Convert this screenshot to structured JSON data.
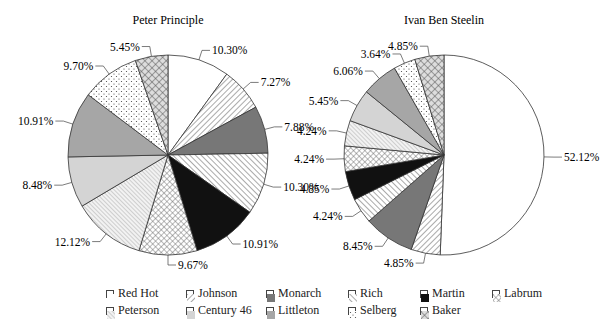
{
  "chart_data": [
    {
      "type": "pie",
      "title": "Peter Principle",
      "categories": [
        "Red Hot",
        "Johnson",
        "Monarch",
        "Rich",
        "Martin",
        "Labrum",
        "Peterson",
        "Century 46",
        "Littleton",
        "Selberg",
        "Baker"
      ],
      "values": [
        10.3,
        7.27,
        7.88,
        10.3,
        10.91,
        9.67,
        12.12,
        8.48,
        10.91,
        9.7,
        5.45
      ],
      "labels": [
        "10.30%",
        "7.27%",
        "7.88%",
        "10.30%",
        "10.91%",
        "9.67%",
        "12.12%",
        "8.48%",
        "10.91%",
        "9.70%",
        "5.45%"
      ],
      "start_angle": "12 o'clock, clockwise"
    },
    {
      "type": "pie",
      "title": "Ivan Ben Steelin",
      "categories": [
        "Red Hot",
        "Johnson",
        "Monarch",
        "Rich",
        "Martin",
        "Labrum",
        "Peterson",
        "Century 46",
        "Littleton",
        "Selberg",
        "Baker"
      ],
      "values": [
        52.12,
        4.85,
        8.45,
        4.24,
        4.85,
        4.24,
        4.24,
        5.45,
        6.06,
        3.64,
        4.85
      ],
      "labels": [
        "52.12%",
        "4.85%",
        "8.45%",
        "4.24%",
        "4.85%",
        "4.24%",
        "4.24%",
        "5.45%",
        "6.06%",
        "3.64%",
        "4.85%"
      ],
      "start_angle": "12 o'clock, clockwise"
    }
  ],
  "legend": {
    "position": "bottom",
    "rows": [
      [
        "Red Hot",
        "Johnson",
        "Monarch",
        "Rich",
        "Martin",
        "Labrum"
      ],
      [
        "Peterson",
        "Century 46",
        "Littleton",
        "Selberg",
        "Baker"
      ]
    ]
  },
  "fills": {
    "Red Hot": "#ffffff",
    "Johnson": "url(#p-diag-r)",
    "Monarch": "#777777",
    "Rich": "url(#p-diag-l)",
    "Martin": "#111111",
    "Labrum": "url(#p-cross)",
    "Peterson": "url(#p-fine)",
    "Century 46": "#d4d4d4",
    "Littleton": "#a6a6a6",
    "Selberg": "url(#p-dots)",
    "Baker": "url(#p-cross2)"
  }
}
